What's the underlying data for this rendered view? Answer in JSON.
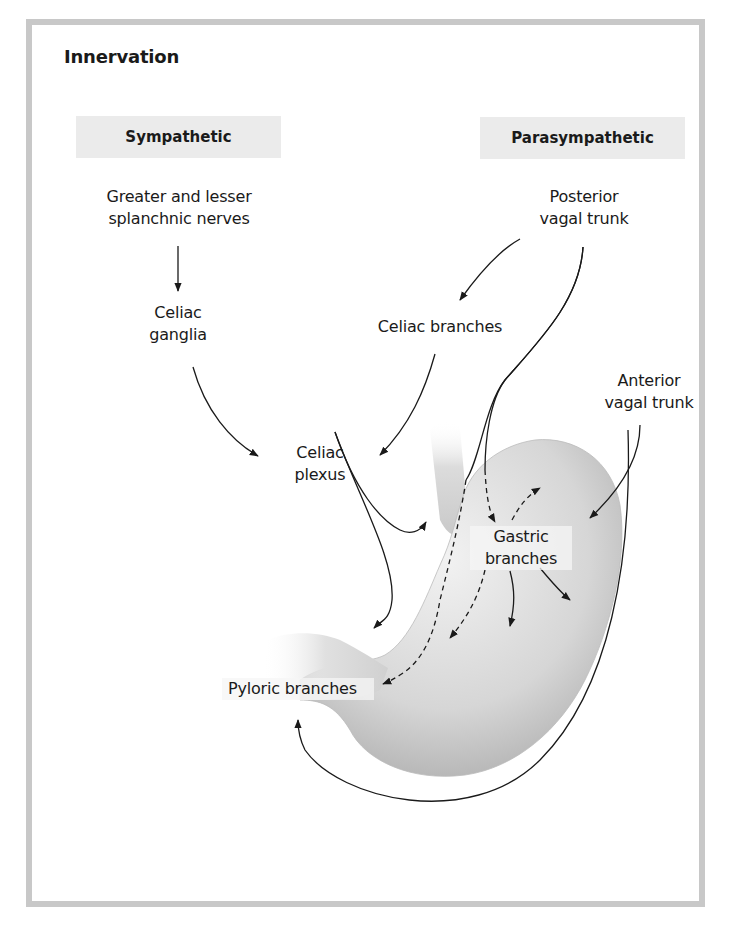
{
  "title": "Innervation",
  "headers": {
    "sympathetic": "Sympathetic",
    "parasympathetic": "Parasympathetic"
  },
  "labels": {
    "greater_lesser": [
      "Greater and lesser",
      "splanchnic nerves"
    ],
    "celiac_ganglia": [
      "Celiac",
      "ganglia"
    ],
    "posterior_vagal": [
      "Posterior",
      "vagal trunk"
    ],
    "celiac_branches": "Celiac branches",
    "anterior_vagal": [
      "Anterior",
      "vagal trunk"
    ],
    "celiac_plexus": [
      "Celiac",
      "plexus"
    ],
    "gastric_branches": [
      "Gastric",
      "branches"
    ],
    "pyloric_branches": "Pyloric branches"
  },
  "colors": {
    "frame": "#c8c8c8",
    "header_bg": "#ebebeb",
    "line": "#1a1a1a",
    "stomach": "#d9d9d9"
  }
}
